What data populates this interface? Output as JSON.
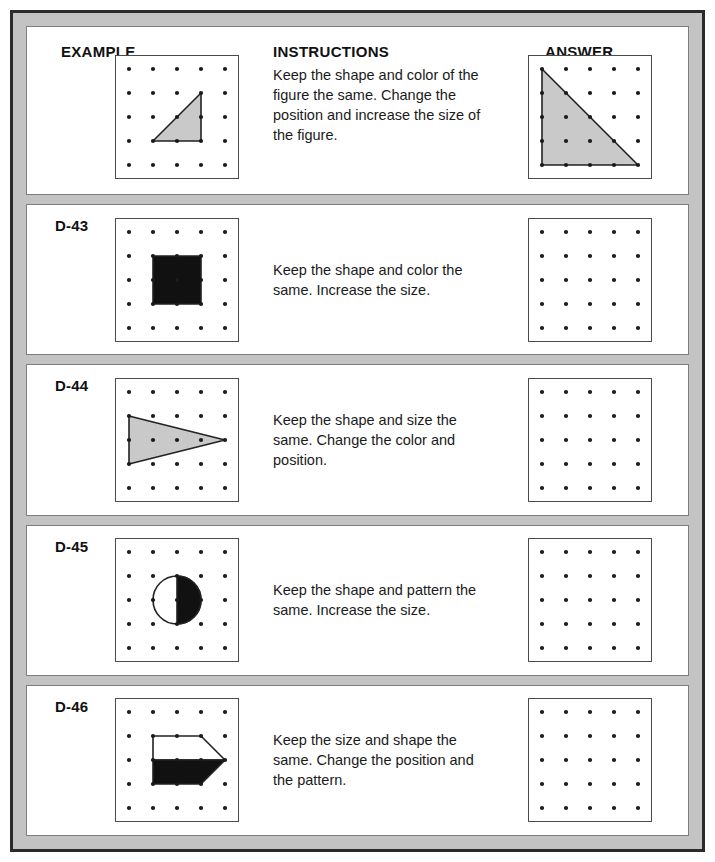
{
  "page": {
    "border_color": "#2b2b2b",
    "background_color": "#c3c3c3",
    "row_background": "#ffffff"
  },
  "headings": {
    "example": "EXAMPLE",
    "instructions": "INSTRUCTIONS",
    "answer": "ANSWER"
  },
  "grid": {
    "cols": 5,
    "rows": 5,
    "dot_color": "#1a1a1a",
    "box_size": 122,
    "cell": 24,
    "margin": 13,
    "dot_radius": 2.1
  },
  "colors": {
    "gray_fill": "#c9c9c9",
    "black_fill": "#111111",
    "white_fill": "#ffffff",
    "stroke": "#222222"
  },
  "rows": [
    {
      "id": "example",
      "code": "EXAMPLE",
      "is_example": true,
      "instructions": "Keep the shape and color of the figure the same. Change the position and increase the size of the figure.",
      "figure": {
        "type": "triangle",
        "fill": "#c9c9c9",
        "points": "2,4 4,4 4,2",
        "description": "small gray right triangle"
      },
      "answer": {
        "type": "triangle",
        "fill": "#c9c9c9",
        "points": "1,1 1,5 5,5",
        "description": "large gray right triangle"
      }
    },
    {
      "id": "d-43",
      "code": "D-43",
      "is_example": false,
      "instructions": "Keep the shape and color the same. Increase the size.",
      "figure": {
        "type": "square",
        "fill": "#111111",
        "points": "2,2 4,2 4,4 2,4",
        "description": "black filled square"
      },
      "answer": {
        "type": "empty",
        "description": "blank dot grid"
      }
    },
    {
      "id": "d-44",
      "code": "D-44",
      "is_example": false,
      "instructions": "Keep the shape and size the same. Change the color and position.",
      "figure": {
        "type": "triangle",
        "fill": "#c9c9c9",
        "points": "1,2 1,4 5,3",
        "description": "gray right-pointing triangle"
      },
      "answer": {
        "type": "empty",
        "description": "blank dot grid"
      }
    },
    {
      "id": "d-45",
      "code": "D-45",
      "is_example": false,
      "instructions": "Keep the shape and pattern the same. Increase the size.",
      "figure": {
        "type": "half-circle",
        "fill": "#111111",
        "center": "3,3",
        "radius": 1,
        "description": "circle with white left half and black right half"
      },
      "answer": {
        "type": "empty",
        "description": "blank dot grid"
      }
    },
    {
      "id": "d-46",
      "code": "D-46",
      "is_example": false,
      "instructions": "Keep the size and shape the same. Change the position and the pattern.",
      "figure": {
        "type": "arrow-pentagon",
        "fill": "#111111",
        "points": "2,2 4,2 5,3 4,4 2,4",
        "description": "arrow shape, white top half and black bottom half"
      },
      "answer": {
        "type": "empty",
        "description": "blank dot grid"
      }
    }
  ]
}
